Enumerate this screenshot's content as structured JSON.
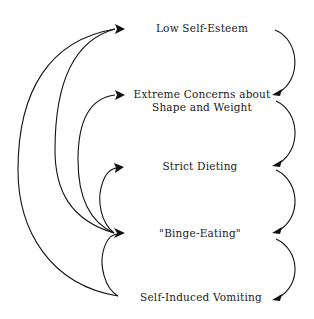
{
  "diagram": {
    "type": "cycle-flow",
    "nodes": [
      {
        "id": "low-self-esteem",
        "label": "Low Self-Esteem"
      },
      {
        "id": "extreme-concerns",
        "label_line1": "Extreme Concerns about",
        "label_line2": "Shape and Weight"
      },
      {
        "id": "strict-dieting",
        "label": "Strict Dieting"
      },
      {
        "id": "binge-eating",
        "label": "\"Binge-Eating\""
      },
      {
        "id": "self-induced-vomiting",
        "label": "Self-Induced Vomiting"
      }
    ],
    "edges_right": [
      {
        "from": "low-self-esteem",
        "to": "extreme-concerns"
      },
      {
        "from": "extreme-concerns",
        "to": "strict-dieting"
      },
      {
        "from": "strict-dieting",
        "to": "binge-eating"
      },
      {
        "from": "binge-eating",
        "to": "self-induced-vomiting"
      }
    ],
    "edges_left": [
      {
        "from": "self-induced-vomiting",
        "to": "low-self-esteem"
      },
      {
        "from": "binge-eating",
        "to": "low-self-esteem"
      },
      {
        "from": "binge-eating",
        "to": "extreme-concerns"
      },
      {
        "from": "binge-eating",
        "to": "strict-dieting"
      },
      {
        "from": "self-induced-vomiting",
        "to": "binge-eating"
      }
    ],
    "colors": {
      "line": "#111111",
      "text": "#1a1a1a",
      "background": "#ffffff"
    }
  }
}
